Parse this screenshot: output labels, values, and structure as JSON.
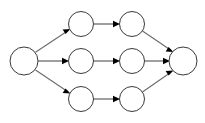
{
  "diagram": {
    "type": "directed-graph",
    "canvas": {
      "width": 205,
      "height": 123,
      "background": "#ffffff"
    },
    "style": {
      "node_stroke": "#3a3a3a",
      "node_fill": "#ffffff",
      "node_stroke_width": 1,
      "edge_stroke": "#6b6b6b",
      "edge_stroke_width": 1.1,
      "arrow_fill": "#000000"
    },
    "nodes": [
      {
        "id": "source",
        "label": "",
        "cx": 24,
        "cy": 61,
        "r": 14,
        "role": "source",
        "row": "middle"
      },
      {
        "id": "t1",
        "label": "",
        "cx": 81,
        "cy": 24,
        "r": 12.5,
        "role": "intermediate",
        "row": "top"
      },
      {
        "id": "t2",
        "label": "",
        "cx": 132,
        "cy": 24,
        "r": 12.5,
        "role": "intermediate",
        "row": "top"
      },
      {
        "id": "m1",
        "label": "",
        "cx": 81,
        "cy": 61,
        "r": 12.5,
        "role": "intermediate",
        "row": "middle"
      },
      {
        "id": "m2",
        "label": "",
        "cx": 132,
        "cy": 61,
        "r": 12.5,
        "role": "intermediate",
        "row": "middle"
      },
      {
        "id": "b1",
        "label": "",
        "cx": 81,
        "cy": 99,
        "r": 12.5,
        "role": "intermediate",
        "row": "bottom"
      },
      {
        "id": "b2",
        "label": "",
        "cx": 132,
        "cy": 99,
        "r": 12.5,
        "role": "intermediate",
        "row": "bottom"
      },
      {
        "id": "sink",
        "label": "",
        "cx": 183,
        "cy": 61,
        "r": 14,
        "role": "sink",
        "row": "middle"
      }
    ],
    "edges": [
      {
        "id": "e-source-t1",
        "from": "source",
        "to": "t1",
        "kind": "diagonal-up"
      },
      {
        "id": "e-source-m1",
        "from": "source",
        "to": "m1",
        "kind": "horizontal"
      },
      {
        "id": "e-source-b1",
        "from": "source",
        "to": "b1",
        "kind": "diagonal-down"
      },
      {
        "id": "e-t1-t2",
        "from": "t1",
        "to": "t2",
        "kind": "horizontal"
      },
      {
        "id": "e-m1-m2",
        "from": "m1",
        "to": "m2",
        "kind": "horizontal"
      },
      {
        "id": "e-b1-b2",
        "from": "b1",
        "to": "b2",
        "kind": "horizontal"
      },
      {
        "id": "e-t2-sink",
        "from": "t2",
        "to": "sink",
        "kind": "diagonal-down"
      },
      {
        "id": "e-m2-sink",
        "from": "m2",
        "to": "sink",
        "kind": "horizontal"
      },
      {
        "id": "e-b2-sink",
        "from": "b2",
        "to": "sink",
        "kind": "diagonal-up"
      }
    ],
    "counts": {
      "nodes": 8,
      "edges": 9,
      "parallel_paths": 3
    }
  }
}
